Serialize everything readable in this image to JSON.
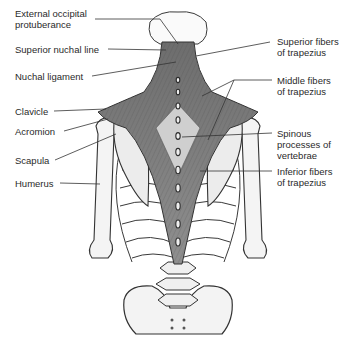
{
  "diagram": {
    "labels_left": [
      {
        "id": "external-occipital-protuberance",
        "line1": "External occipital",
        "line2": "protuberance"
      },
      {
        "id": "superior-nuchal-line",
        "line1": "Superior nuchal line",
        "line2": ""
      },
      {
        "id": "nuchal-ligament",
        "line1": "Nuchal ligament",
        "line2": ""
      },
      {
        "id": "clavicle",
        "line1": "Clavicle",
        "line2": ""
      },
      {
        "id": "acromion",
        "line1": "Acromion",
        "line2": ""
      },
      {
        "id": "scapula",
        "line1": "Scapula",
        "line2": ""
      },
      {
        "id": "humerus",
        "line1": "Humerus",
        "line2": ""
      }
    ],
    "labels_right": [
      {
        "id": "superior-fibers",
        "line1": "Superior fibers",
        "line2": "of trapezius"
      },
      {
        "id": "middle-fibers",
        "line1": "Middle fibers",
        "line2": "of trapezius"
      },
      {
        "id": "spinous-processes",
        "line1": "Spinous",
        "line2": "processes of",
        "line3": "vertebrae"
      },
      {
        "id": "inferior-fibers",
        "line1": "Inferior fibers",
        "line2": "of trapezius"
      }
    ],
    "colors": {
      "line": "#333333",
      "bone": "#f2f2f2",
      "muscle": "#8a8a8a",
      "muscle_dark": "#5a5a5a",
      "outline": "#3a3a3a"
    }
  }
}
